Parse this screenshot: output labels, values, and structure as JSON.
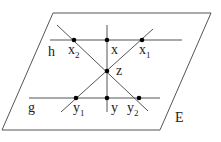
{
  "diagram": {
    "plane": {
      "label": "E",
      "corners": [
        [
          53,
          13
        ],
        [
          211,
          13
        ],
        [
          160,
          130
        ],
        [
          2,
          130
        ]
      ],
      "stroke": "#555555"
    },
    "lines": {
      "h": {
        "label": "h",
        "from": [
          50,
          40
        ],
        "to": [
          182,
          40
        ]
      },
      "g": {
        "label": "g",
        "from": [
          29,
          98
        ],
        "to": [
          160,
          98
        ]
      },
      "vertical": {
        "from": [
          107,
          25
        ],
        "to": [
          107,
          112
        ]
      },
      "diag_x2_y2": {
        "from": [
          57,
          25
        ],
        "to": [
          148,
          111
        ]
      },
      "diag_y1_x1": {
        "from": [
          61,
          112
        ],
        "to": [
          153,
          29
        ]
      }
    },
    "points": [
      {
        "id": "x2",
        "base": "x",
        "sub": "2",
        "pos": [
          74,
          40
        ]
      },
      {
        "id": "x",
        "base": "x",
        "sub": "",
        "pos": [
          107,
          40
        ]
      },
      {
        "id": "x1",
        "base": "x",
        "sub": "1",
        "pos": [
          142,
          40
        ]
      },
      {
        "id": "z",
        "base": "z",
        "sub": "",
        "pos": [
          107,
          71
        ]
      },
      {
        "id": "y1",
        "base": "y",
        "sub": "1",
        "pos": [
          76,
          98
        ]
      },
      {
        "id": "y",
        "base": "y",
        "sub": "",
        "pos": [
          107,
          98
        ]
      },
      {
        "id": "y2",
        "base": "y",
        "sub": "2",
        "pos": [
          139,
          98
        ]
      }
    ],
    "labels": {
      "h": "h",
      "g": "g",
      "E": "E",
      "x2_base": "x",
      "x2_sub": "2",
      "x_base": "x",
      "x1_base": "x",
      "x1_sub": "1",
      "z_base": "z",
      "y1_base": "y",
      "y1_sub": "1",
      "y_base": "y",
      "y2_base": "y",
      "y2_sub": "2"
    },
    "colors": {
      "line": "#555555",
      "point": "#000000",
      "text": "#222222"
    }
  }
}
